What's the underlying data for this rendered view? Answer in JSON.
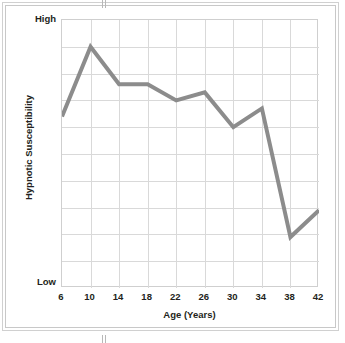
{
  "figure": {
    "background": "#ffffff",
    "frame_color": "#d0d0d0"
  },
  "axis": {
    "y_high_label": "High",
    "y_low_label": "Low",
    "y_title": "Hypnotic Susceptibility",
    "x_title": "Age (Years)"
  },
  "chart_data": {
    "type": "line",
    "title": "",
    "xlabel": "Age (Years)",
    "ylabel": "Hypnotic Susceptibility",
    "x": [
      6,
      10,
      14,
      18,
      22,
      26,
      30,
      34,
      38,
      42
    ],
    "categories": [
      "6",
      "10",
      "14",
      "18",
      "22",
      "26",
      "30",
      "34",
      "38",
      "42"
    ],
    "values": [
      64,
      90,
      76,
      76,
      70,
      73,
      60,
      67,
      19,
      29
    ],
    "series": [
      {
        "name": "Hypnotic Susceptibility",
        "values": [
          64,
          90,
          76,
          76,
          70,
          73,
          60,
          67,
          19,
          29
        ],
        "color": "#8c8c8c",
        "line_width": 4
      }
    ],
    "xlim": [
      6,
      42
    ],
    "ylim": [
      0,
      100
    ],
    "ytick_labels": [
      "Low",
      "High"
    ],
    "ytick_values": [
      0,
      100
    ],
    "grid": true,
    "grid_color": "#d9d9d9",
    "grid_rows": 10,
    "grid_cols": 9,
    "legend": "none"
  }
}
